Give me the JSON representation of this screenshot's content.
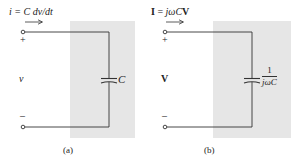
{
  "panels": [
    {
      "id": "a",
      "caption": "(a)",
      "current_label": "i = C dv/dt",
      "voltage_label": "v",
      "plus_sign": "+",
      "minus_sign": "–",
      "component_label": "C",
      "domain": "time"
    },
    {
      "id": "b",
      "caption": "(b)",
      "current_label": "I = jωCV",
      "current_label_parts": {
        "bold_I": "I",
        "eq": " = ",
        "jw": "jω",
        "C": "C",
        "bold_V": "V"
      },
      "voltage_label": "V",
      "plus_sign": "+",
      "minus_sign": "–",
      "component_label_numerator": "1",
      "component_label_denominator": "jωC",
      "domain": "frequency"
    }
  ],
  "colors": {
    "shade": "#e6e6e6",
    "wire": "#333333",
    "text": "#222222"
  }
}
